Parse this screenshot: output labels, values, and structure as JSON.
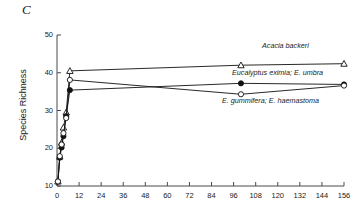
{
  "figure": {
    "panel_label": "C",
    "ylabel": "Species Richness",
    "xlabel": ""
  },
  "axes": {
    "y_ticks": [
      10,
      20,
      30,
      40,
      50
    ],
    "x_ticks": [
      0,
      12,
      24,
      36,
      48,
      60,
      72,
      84,
      96,
      108,
      120,
      132,
      144,
      156
    ],
    "ylim": [
      10,
      50
    ],
    "xlim": [
      0,
      156
    ],
    "axis_color": "#4a4a4a"
  },
  "annotations": [
    {
      "name": "acacia-backeri-label",
      "text": "Acacia backeri",
      "x": 262,
      "y": 41
    },
    {
      "name": "eucalyptus-eximia-label",
      "text": "Eucalyptus eximia; E. umbra",
      "x": 232,
      "y": 68
    },
    {
      "name": "e-gummifera-label",
      "text": "E. gummifera; E. haemastoma",
      "x": 222,
      "y": 96
    }
  ],
  "chart_data": {
    "type": "line",
    "title": "C",
    "xlabel": "",
    "ylabel": "Species Richness",
    "xlim": [
      0,
      156
    ],
    "ylim": [
      10,
      50
    ],
    "xticks": [
      0,
      12,
      24,
      36,
      48,
      60,
      72,
      84,
      96,
      108,
      120,
      132,
      144,
      156
    ],
    "yticks": [
      10,
      20,
      30,
      40,
      50
    ],
    "grid": false,
    "legend": "inline-annotations",
    "series": [
      {
        "name": "Acacia backeri",
        "marker": "open-triangle",
        "x": [
          0.5,
          1.5,
          2.5,
          3.5,
          5,
          7,
          100,
          156
        ],
        "y": [
          11.2,
          17.8,
          21.5,
          25.5,
          29.5,
          40.5,
          42.0,
          42.4
        ]
      },
      {
        "name": "Eucalyptus eximia; E. umbra",
        "marker": "filled-circle",
        "x": [
          0.5,
          1.5,
          2.5,
          3.5,
          5,
          7,
          100,
          156
        ],
        "y": [
          11.2,
          17.5,
          20.2,
          23.2,
          28.5,
          35.4,
          37.2,
          36.9
        ]
      },
      {
        "name": "E. gummifera; E. haemastoma",
        "marker": "open-circle",
        "x": [
          0.5,
          1.5,
          2.5,
          3.5,
          5,
          7,
          100,
          156
        ],
        "y": [
          11.2,
          17.9,
          21.0,
          24.0,
          28.0,
          38.1,
          34.3,
          36.6
        ]
      }
    ]
  }
}
